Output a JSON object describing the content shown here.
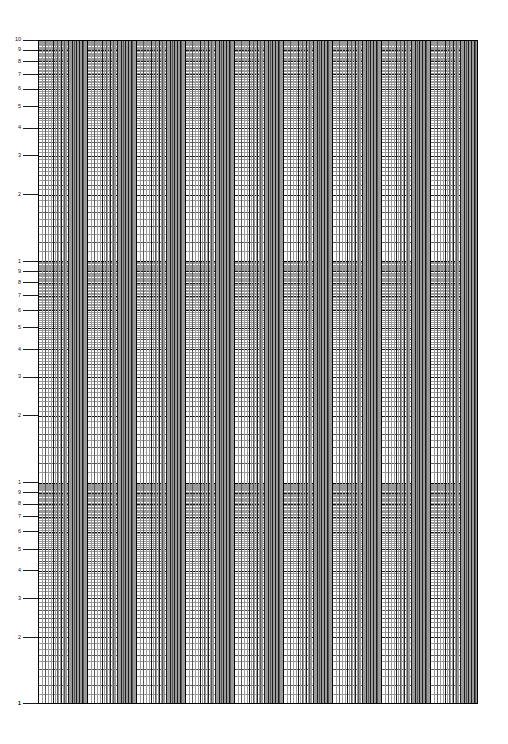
{
  "sheet": {
    "title": "Three-cycle logarithmic graph paper",
    "width": 508,
    "height": 744,
    "background_color": "#ffffff",
    "line_color_minor": "#9a9a9a",
    "line_color_mid": "#585858",
    "line_color_major": "#1c1c1c",
    "line_color_decade": "#000000"
  },
  "plot": {
    "left": 38,
    "top": 40,
    "width": 440,
    "height": 664,
    "decades_y": 3,
    "decades_x": 9,
    "x_decade_width": 49,
    "y_decade_height": 221.3
  },
  "chart_data": {
    "type": "line",
    "title": "",
    "subtitle": "",
    "xlabel": "",
    "ylabel": "",
    "grid": true,
    "legend": "none",
    "x_scale": "log",
    "y_scale": "log",
    "series": [],
    "annotations": [],
    "xlim": [
      1,
      1000000000
    ],
    "ylim": [
      1,
      1000
    ],
    "y_axis": {
      "scale": "log",
      "cycles": 3,
      "direction": "descending",
      "tick_labels_per_decade": [
        "10",
        "9",
        "8",
        "7",
        "6",
        "5",
        "4",
        "3",
        "2"
      ],
      "decade_end_label": "1",
      "labels_top_to_bottom": [
        "10",
        "9",
        "8",
        "7",
        "6",
        "5",
        "4",
        "3",
        "2",
        "1",
        "9",
        "8",
        "7",
        "6",
        "5",
        "4",
        "3",
        "2",
        "1",
        "9",
        "8",
        "7",
        "6",
        "5",
        "4",
        "3",
        "2",
        "1"
      ],
      "labeled_values_decade": [
        10,
        9,
        8,
        7,
        6,
        5,
        4,
        3,
        2,
        1
      ]
    },
    "x_axis": {
      "scale": "log",
      "cycles": 9,
      "tick_labels": [],
      "minor_ticks_per_decade": 9
    },
    "categories": [],
    "values": []
  }
}
